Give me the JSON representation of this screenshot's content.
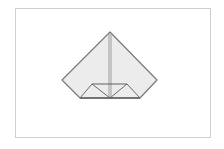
{
  "diagram": {
    "type": "origami-fold-step",
    "frame": {
      "x": 15,
      "y": 8,
      "width": 196,
      "height": 130,
      "border_color": "#cfcfcf",
      "background": "#ffffff"
    },
    "colors": {
      "paper_fill": "#ececec",
      "line": "#7a7a7a",
      "line_dark": "#5e5e5e"
    },
    "shapes": {
      "outline": [
        [
          110,
          32
        ],
        [
          157,
          80
        ],
        [
          140,
          98
        ],
        [
          80,
          98
        ],
        [
          62,
          80
        ]
      ],
      "center_crease": [
        [
          109,
          33
        ],
        [
          109,
          98
        ]
      ],
      "center_crease_2": [
        [
          111,
          33
        ],
        [
          111,
          98
        ]
      ],
      "band_top": [
        [
          92,
          84
        ],
        [
          127,
          84
        ]
      ],
      "left_small_triangle": [
        [
          92,
          84
        ],
        [
          80,
          98
        ],
        [
          110,
          98
        ]
      ],
      "right_small_triangle": [
        [
          127,
          84
        ],
        [
          110,
          98
        ],
        [
          140,
          98
        ]
      ]
    }
  }
}
